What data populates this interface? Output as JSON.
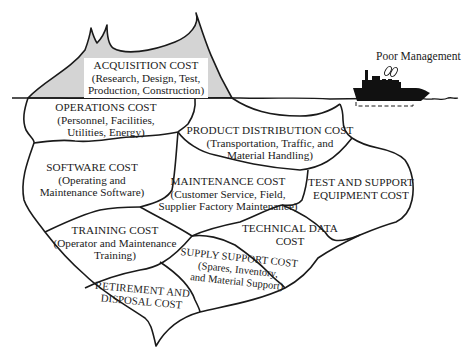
{
  "diagram": {
    "type": "iceberg",
    "colors": {
      "above_water_fill": "#d4d4d4",
      "line": "#1a1a1a",
      "background": "#ffffff",
      "ship": "#111111"
    },
    "above_water": {
      "acquisition": {
        "title": "ACQUISITION COST",
        "line1": "(Research, Design, Test,",
        "line2": "Production, Construction)"
      }
    },
    "below_water": {
      "operations": {
        "title": "OPERATIONS COST",
        "line1": "(Personnel, Facilities,",
        "line2": "Utilities, Energy)"
      },
      "product_distribution": {
        "title": "PRODUCT DISTRIBUTION COST",
        "line1": "(Transportation, Traffic, and",
        "line2": "Material Handling)"
      },
      "software": {
        "title": "SOFTWARE COST",
        "line1": "(Operating and",
        "line2": "Maintenance Software)"
      },
      "maintenance": {
        "title": "MAINTENANCE COST",
        "line1": "(Customer Service, Field,",
        "line2": "Supplier Factory Maintenance)"
      },
      "test_support": {
        "title": "TEST AND SUPPORT",
        "line1": "EQUIPMENT COST"
      },
      "training": {
        "title": "TRAINING COST",
        "line1": "(Operator and Maintenance",
        "line2": "Training)"
      },
      "technical_data": {
        "title": "TECHNICAL DATA",
        "line1": "COST"
      },
      "supply_support": {
        "title": "SUPPLY SUPPORT COST",
        "line1": "(Spares, Inventory,",
        "line2": "and Material Support)"
      },
      "retirement": {
        "title": "RETIREMENT AND",
        "line1": "DISPOSAL COST"
      }
    },
    "ship": {
      "label": "Poor Management",
      "icon": "ship-icon"
    }
  }
}
